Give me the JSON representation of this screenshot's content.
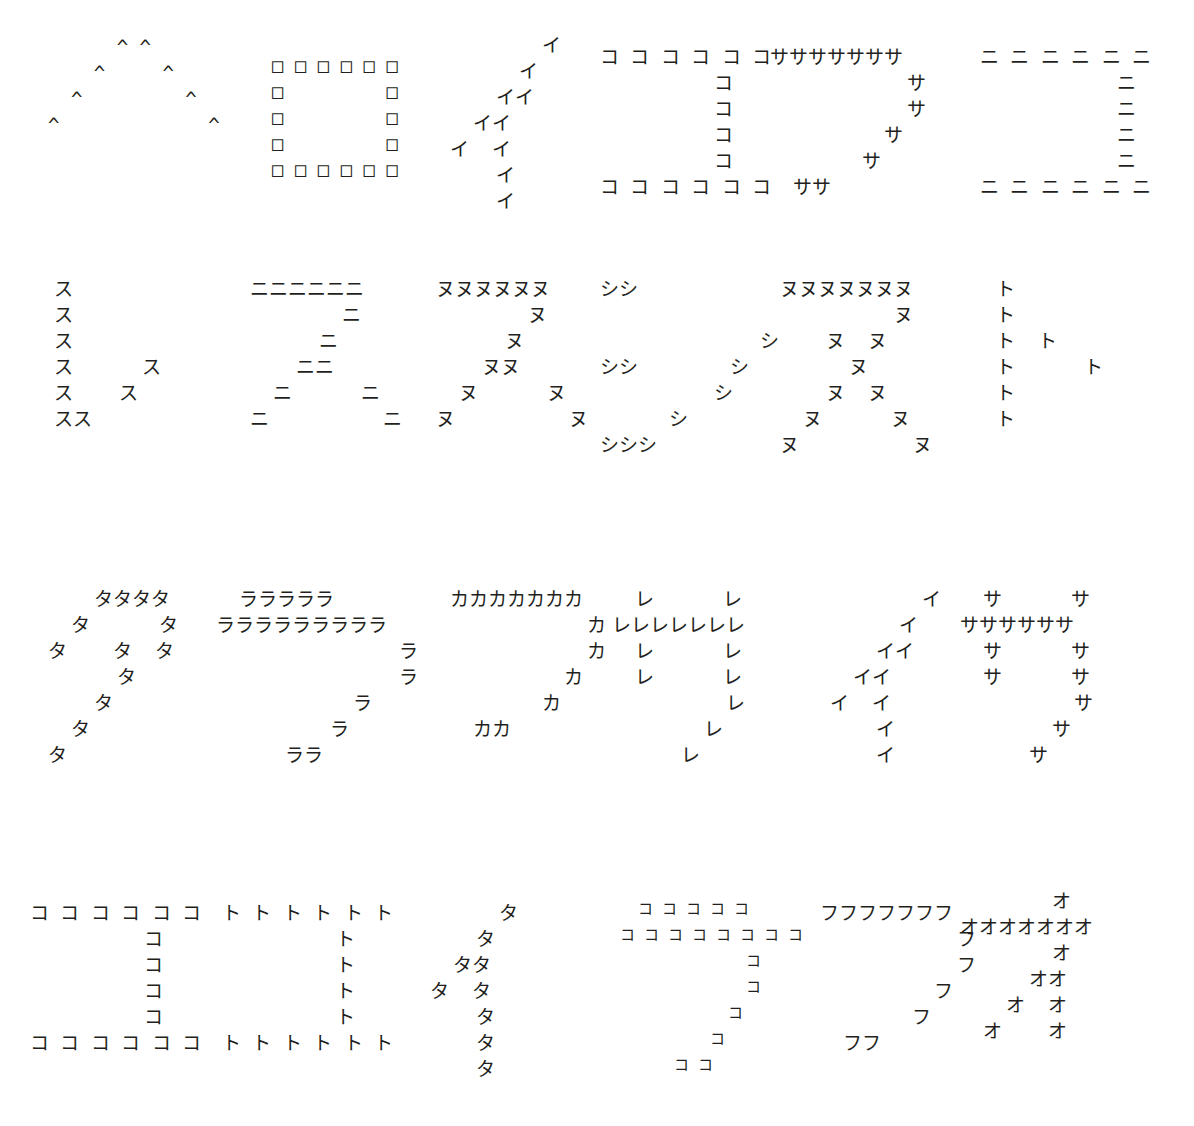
{
  "page": {
    "background_color": "#ffffff",
    "ink_color": "#231f20",
    "width": 1194,
    "height": 1126,
    "rows": 4,
    "columns": 6
  },
  "figures": [
    {
      "id": "fig-1",
      "row": 1,
      "col": 1,
      "tile_char": "^",
      "depicts": "caret-peak",
      "left": 48,
      "top": 34,
      "font_size": 19,
      "line_height": 26,
      "pattern": "      ^ ^\n    ^     ^\n  ^         ^\n^             ^"
    },
    {
      "id": "fig-2",
      "row": 1,
      "col": 2,
      "tile_char": "□",
      "depicts": "square-outline",
      "left": 272,
      "top": 52,
      "font_size": 19,
      "line_height": 26,
      "pattern": "□ □ □ □ □ □\n□         □\n□         □\n□         □\n□ □ □ □ □ □"
    },
    {
      "id": "fig-3",
      "row": 1,
      "col": 3,
      "tile_char": "イ",
      "depicts": "seven-stroke",
      "left": 450,
      "top": 32,
      "font_size": 19,
      "line_height": 26,
      "pattern": "        イ\n      イ\n    イイ\n  イイ\nイ  イ\n    イ\n    イ"
    },
    {
      "id": "fig-4",
      "row": 1,
      "col": 4,
      "tile_char": "コ",
      "depicts": "square-bracket-box",
      "left": 600,
      "top": 44,
      "font_size": 19,
      "line_height": 26,
      "pattern": "コ コ コ コ コ コ\n          コ\n          コ\n          コ\n          コ\nコ コ コ コ コ コ"
    },
    {
      "id": "fig-5",
      "row": 1,
      "col": 5,
      "tile_char": "サ",
      "depicts": "seven-stroke",
      "left": 770,
      "top": 44,
      "font_size": 19,
      "line_height": 26,
      "pattern": "サササササササ\n            サ\n            サ\n          サ\n        サ\n  ササ"
    },
    {
      "id": "fig-6",
      "row": 1,
      "col": 6,
      "tile_char": "ニ",
      "depicts": "square-bracket-box",
      "left": 980,
      "top": 44,
      "font_size": 19,
      "line_height": 26,
      "pattern": "ニ ニ ニ ニ ニ ニ\n            ニ\n            ニ\n            ニ\n            ニ\nニ ニ ニ ニ ニ ニ"
    },
    {
      "id": "fig-7",
      "row": 2,
      "col": 1,
      "tile_char": "ス",
      "depicts": "check-mark",
      "left": 54,
      "top": 276,
      "font_size": 19,
      "line_height": 26,
      "pattern": "ス\nス\nス\nス      ス\nス    ス\nスス"
    },
    {
      "id": "fig-8",
      "row": 2,
      "col": 2,
      "tile_char": "ニ",
      "depicts": "arrow-fork",
      "left": 250,
      "top": 276,
      "font_size": 19,
      "line_height": 26,
      "pattern": "ニニニニニニ\n        ニ\n      ニ\n    ニニ\n  ニ      ニ\nニ          ニ"
    },
    {
      "id": "fig-9",
      "row": 2,
      "col": 3,
      "tile_char": "ヌ",
      "depicts": "nu-stroke",
      "left": 436,
      "top": 276,
      "font_size": 19,
      "line_height": 26,
      "pattern": "ヌヌヌヌヌヌ\n        ヌ\n      ヌ\n    ヌヌ\n  ヌ      ヌ\nヌ          ヌ"
    },
    {
      "id": "fig-10",
      "row": 2,
      "col": 4,
      "tile_char": "シ",
      "depicts": "shi-stroke",
      "left": 600,
      "top": 276,
      "font_size": 19,
      "line_height": 26,
      "pattern": "シシ\n\n              シ\nシシ        シ\n          シ\n      シ\nシシシ"
    },
    {
      "id": "fig-11",
      "row": 2,
      "col": 5,
      "tile_char": "ヌ",
      "depicts": "nu-stroke",
      "left": 780,
      "top": 276,
      "font_size": 19,
      "line_height": 26,
      "pattern": "ヌヌヌヌヌヌヌ\n          ヌ\n    ヌ  ヌ\n      ヌ\n    ヌ  ヌ\n  ヌ      ヌ\nヌ          ヌ"
    },
    {
      "id": "fig-12",
      "row": 2,
      "col": 6,
      "tile_char": "ト",
      "depicts": "to-stroke",
      "left": 996,
      "top": 276,
      "font_size": 19,
      "line_height": 26,
      "pattern": "ト\nト\nト  ト\nト      ト\nト\nト"
    },
    {
      "id": "fig-13",
      "row": 3,
      "col": 1,
      "tile_char": "タ",
      "depicts": "ta-stroke",
      "left": 48,
      "top": 586,
      "font_size": 19,
      "line_height": 26,
      "pattern": "    タタタタ\n  タ      タ\nタ    タ  タ\n      タ\n    タ\n  タ\nタ"
    },
    {
      "id": "fig-14",
      "row": 3,
      "col": 2,
      "tile_char": "ラ",
      "depicts": "ra-stroke",
      "left": 216,
      "top": 586,
      "font_size": 19,
      "line_height": 26,
      "pattern": "  ラララララ\nラララララララララ\n                ラ\n                ラ\n            ラ\n          ラ\n      ララ"
    },
    {
      "id": "fig-15",
      "row": 3,
      "col": 3,
      "tile_char": "カ",
      "depicts": "seven-stroke",
      "left": 450,
      "top": 586,
      "font_size": 19,
      "line_height": 26,
      "pattern": "カカカカカカカ\n            カ\n            カ\n          カ\n        カ\n  カカ"
    },
    {
      "id": "fig-16",
      "row": 3,
      "col": 4,
      "tile_char": "レ",
      "depicts": "sa-stroke",
      "left": 612,
      "top": 586,
      "font_size": 19,
      "line_height": 26,
      "pattern": "  レ      レ\nレレレレレレレ\n  レ      レ\n  レ      レ\n          レ\n        レ\n      レ"
    },
    {
      "id": "fig-17",
      "row": 3,
      "col": 5,
      "tile_char": "イ",
      "depicts": "seven-stroke",
      "left": 830,
      "top": 586,
      "font_size": 19,
      "line_height": 26,
      "pattern": "        イ\n      イ\n    イイ\n  イイ\nイ  イ\n    イ\n    イ"
    },
    {
      "id": "fig-18",
      "row": 3,
      "col": 6,
      "tile_char": "サ",
      "depicts": "sa-stroke",
      "left": 960,
      "top": 586,
      "font_size": 19,
      "line_height": 26,
      "pattern": "  サ      サ\nササササササ\n  サ      サ\n  サ      サ\n          サ\n        サ\n      サ"
    },
    {
      "id": "fig-19",
      "row": 4,
      "col": 1,
      "tile_char": "コ",
      "depicts": "square-bracket-box",
      "left": 30,
      "top": 900,
      "font_size": 19,
      "line_height": 26,
      "pattern": "コ コ コ コ コ コ\n          コ\n          コ\n          コ\n          コ\nコ コ コ コ コ コ"
    },
    {
      "id": "fig-20",
      "row": 4,
      "col": 2,
      "tile_char": "ト",
      "depicts": "square-bracket-box",
      "left": 222,
      "top": 900,
      "font_size": 19,
      "line_height": 26,
      "pattern": "ト ト ト ト ト ト\n          ト\n          ト\n          ト\n          ト\nト ト ト ト ト ト"
    },
    {
      "id": "fig-21",
      "row": 4,
      "col": 3,
      "tile_char": "タ",
      "depicts": "ta-stroke",
      "left": 430,
      "top": 900,
      "font_size": 19,
      "line_height": 26,
      "pattern": "      タ\n    タ\n  タタ\nタ  タ\n    タ\n    タ\n    タ"
    },
    {
      "id": "fig-22",
      "row": 4,
      "col": 4,
      "tile_char": "コ",
      "depicts": "ra-stroke",
      "left": 620,
      "top": 896,
      "font_size": 15,
      "line_height": 26,
      "pattern": "  コ コ コ コ コ\nコ コ コ コ コ コ コ コ\n              コ\n              コ\n            コ\n          コ\n      コ コ"
    },
    {
      "id": "fig-23",
      "row": 4,
      "col": 5,
      "tile_char": "フ",
      "depicts": "seven-stroke",
      "left": 820,
      "top": 900,
      "font_size": 19,
      "line_height": 26,
      "pattern": "フフフフフフフ\n            フ\n            フ\n          フ\n        フ\n  フフ"
    },
    {
      "id": "fig-24",
      "row": 4,
      "col": 6,
      "tile_char": "オ",
      "depicts": "o-stroke",
      "left": 960,
      "top": 888,
      "font_size": 19,
      "line_height": 26,
      "pattern": "        オ\nオオオオオオオ\n        オ\n      オオ\n    オ  オ\n  オ    オ"
    }
  ]
}
